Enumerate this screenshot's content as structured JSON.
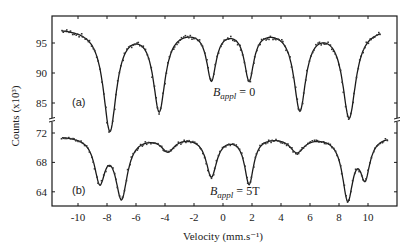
{
  "chart_data": {
    "type": "line",
    "title": "",
    "xlabel": "Velocity (mm.s⁻¹)",
    "ylabel": "Counts (x10³)",
    "xlim": [
      -11.5,
      12.0
    ],
    "x_ticks": [
      -10,
      -8,
      -6,
      -4,
      -2,
      0,
      2,
      4,
      6,
      8,
      10
    ],
    "x_tick_labels": [
      "-10",
      "-8",
      "-6",
      "-4",
      "-2",
      "0",
      "2",
      "4",
      "6",
      "8",
      "10"
    ],
    "grid": false,
    "legend": null,
    "broken_y_axis": true,
    "panels": [
      {
        "label": "(a)",
        "annotation": "B_appl = 0",
        "annotation_main": "B",
        "annotation_sub": "appl",
        "annotation_rest": " = 0",
        "ylim": [
          80,
          99.5
        ],
        "y_ticks": [
          95,
          90,
          85
        ],
        "y_tick_labels": [
          "95",
          "90",
          "85"
        ],
        "baseline": 97.6,
        "lines": [
          {
            "center": -7.8,
            "depth": 17.0,
            "width": 0.55
          },
          {
            "center": -4.4,
            "depth": 13.5,
            "width": 0.5
          },
          {
            "center": -0.8,
            "depth": 8.3,
            "width": 0.4
          },
          {
            "center": 1.8,
            "depth": 8.3,
            "width": 0.4
          },
          {
            "center": 5.3,
            "depth": 13.4,
            "width": 0.5
          },
          {
            "center": 8.7,
            "depth": 14.8,
            "width": 0.55
          }
        ],
        "minima": [
          {
            "x": -7.8,
            "y": 80.6
          },
          {
            "x": -4.4,
            "y": 84.1
          },
          {
            "x": -0.8,
            "y": 89.3
          },
          {
            "x": 1.8,
            "y": 89.3
          },
          {
            "x": 5.3,
            "y": 84.2
          },
          {
            "x": 8.7,
            "y": 82.8
          }
        ]
      },
      {
        "label": "(b)",
        "annotation": "B_appl = 5T",
        "annotation_main": "B",
        "annotation_sub": "appl",
        "annotation_rest": " = 5T",
        "ylim": [
          62.2,
          72.3
        ],
        "y_ticks": [
          72,
          68,
          64
        ],
        "y_tick_labels": [
          "72",
          "68",
          "64"
        ],
        "baseline": 71.7,
        "lines": [
          {
            "center": -8.5,
            "depth": 5.9,
            "width": 0.45
          },
          {
            "center": -7.0,
            "depth": 8.2,
            "width": 0.5
          },
          {
            "center": -3.8,
            "depth": 1.9,
            "width": 0.55
          },
          {
            "center": -0.8,
            "depth": 5.4,
            "width": 0.45
          },
          {
            "center": 1.8,
            "depth": 6.4,
            "width": 0.38
          },
          {
            "center": 5.1,
            "depth": 2.1,
            "width": 0.6
          },
          {
            "center": 8.6,
            "depth": 8.4,
            "width": 0.45
          },
          {
            "center": 9.8,
            "depth": 5.2,
            "width": 0.4
          }
        ],
        "minima": [
          {
            "x": -8.5,
            "y": 65.3
          },
          {
            "x": -7.0,
            "y": 63.2
          },
          {
            "x": -3.8,
            "y": 69.6
          },
          {
            "x": -0.8,
            "y": 66.1
          },
          {
            "x": 1.8,
            "y": 65.0
          },
          {
            "x": 5.1,
            "y": 69.4
          },
          {
            "x": 8.6,
            "y": 63.0
          },
          {
            "x": 9.8,
            "y": 66.1
          }
        ]
      }
    ]
  },
  "colors": {
    "line": "#1a1a1a",
    "points": "#333333",
    "axis": "#1a1a1a",
    "background": "#ffffff"
  }
}
